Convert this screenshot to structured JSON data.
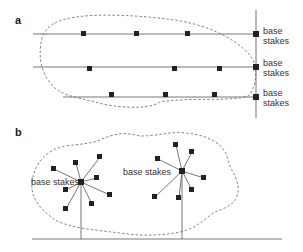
{
  "panels": [
    {
      "label": "a",
      "stake_label": "base stakes",
      "stake_label_lines": [
        "base",
        "stakes"
      ],
      "rows": [
        {
          "stakes_count": 3
        },
        {
          "stakes_count": 3
        },
        {
          "stakes_count": 3
        }
      ]
    },
    {
      "label": "b",
      "stake_label": "base stakes",
      "trees": [
        {
          "branches_count": 8
        },
        {
          "branches_count": 7
        }
      ]
    }
  ],
  "colors": {
    "line": "#666666",
    "marker": "#222222",
    "boundary": "#777777"
  }
}
